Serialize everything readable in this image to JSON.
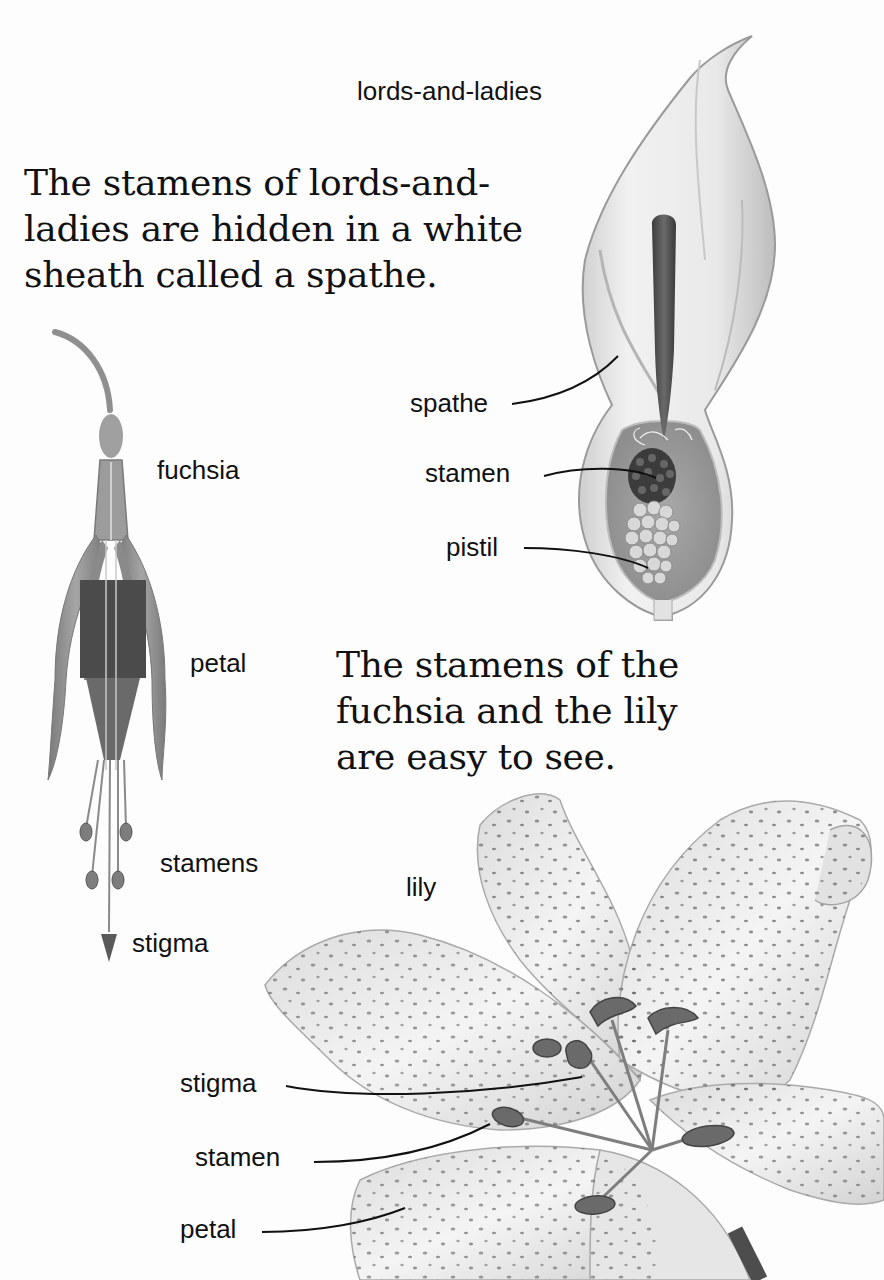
{
  "paragraphs": {
    "lords_and_ladies": {
      "lines": [
        "The stamens of lords-and-",
        "ladies are hidden in a white",
        "sheath called a spathe."
      ]
    },
    "fuchsia_and_lily": {
      "lines": [
        "The stamens of the",
        "fuchsia and the lily",
        "are easy to see."
      ]
    }
  },
  "illustrations": {
    "lords_and_ladies": {
      "title": "lords-and-ladies",
      "labels": {
        "spathe": "spathe",
        "stamen": "stamen",
        "pistil": "pistil"
      }
    },
    "fuchsia": {
      "title": "fuchsia",
      "labels": {
        "petal": "petal",
        "stamens": "stamens",
        "stigma": "stigma"
      }
    },
    "lily": {
      "title": "lily",
      "labels": {
        "stigma": "stigma",
        "stamen": "stamen",
        "petal": "petal"
      }
    }
  },
  "colors": {
    "text": "#111111",
    "background": "#fdfdfd",
    "illustration_dark": "#4a4a4a",
    "illustration_mid": "#9a9a9a",
    "illustration_light": "#e6e6e6"
  }
}
